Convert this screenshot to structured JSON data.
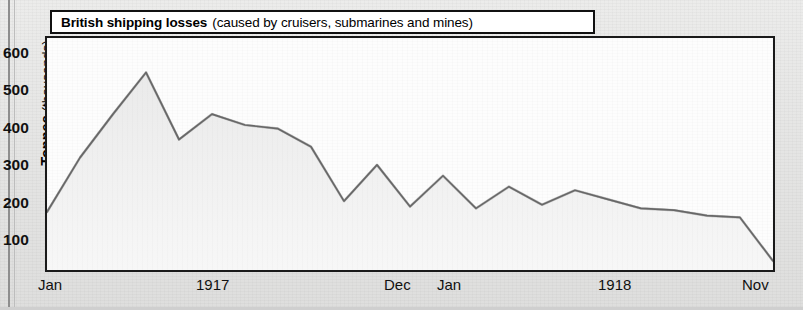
{
  "figure": {
    "title_main": "British shipping losses",
    "title_sub": "(caused by cruisers, submarines and mines)"
  },
  "axes": {
    "y_label_bold": "Tonnes",
    "y_label_rest": "(thousands)",
    "y_ticks": [
      "600",
      "500",
      "400",
      "300",
      "200",
      "100"
    ],
    "x_ticks": [
      "Jan",
      "1917",
      "Dec",
      "Jan",
      "1918",
      "Nov"
    ]
  },
  "colors": {
    "line": "#2b2b2b",
    "fill": "#f0f0f0",
    "frame": "#1a1a1a",
    "page_background": "#e6e6e5",
    "plot_background": "#fdfdfd"
  },
  "chart_data": {
    "type": "area",
    "title": "British shipping losses (caused by cruisers, submarines and mines)",
    "xlabel": "",
    "ylabel": "Tonnes (thousands)",
    "ylim": [
      0,
      640
    ],
    "grid": false,
    "legend": null,
    "x": [
      "Jan 1917",
      "Feb 1917",
      "Mar 1917",
      "Apr 1917",
      "May 1917",
      "Jun 1917",
      "Jul 1917",
      "Aug 1917",
      "Sep 1917",
      "Oct 1917",
      "Nov 1917",
      "Dec 1917",
      "Jan 1918",
      "Feb 1918",
      "Mar 1918",
      "Apr 1918",
      "May 1918",
      "Jun 1918",
      "Jul 1918",
      "Aug 1918",
      "Sep 1918",
      "Oct 1918",
      "Nov 1918"
    ],
    "values": [
      160,
      310,
      430,
      545,
      360,
      430,
      400,
      390,
      340,
      190,
      290,
      175,
      260,
      170,
      230,
      180,
      220,
      195,
      170,
      165,
      150,
      145,
      25
    ],
    "units": "thousands of tonnes",
    "x_axis_tick_labels": [
      "Jan",
      "1917",
      "Dec",
      "Jan",
      "1918",
      "Nov"
    ],
    "y_axis_tick_values": [
      100,
      200,
      300,
      400,
      500,
      600
    ],
    "peak": {
      "label": "Apr 1917",
      "value": 545
    },
    "end": {
      "label": "Nov 1918",
      "value": 25
    }
  }
}
